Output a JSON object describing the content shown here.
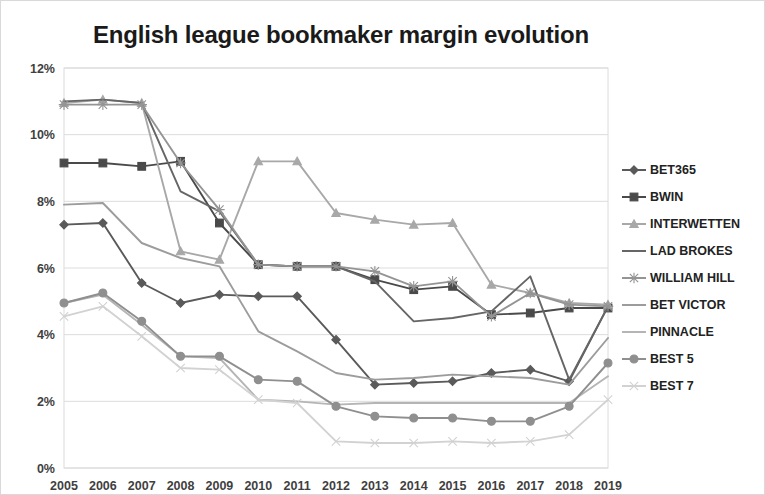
{
  "chart_data": {
    "type": "line",
    "title": "English league bookmaker margin evolution",
    "xlabel": "",
    "ylabel": "",
    "ylim": [
      0,
      12
    ],
    "ytick_labels": [
      "0%",
      "2%",
      "4%",
      "6%",
      "8%",
      "10%",
      "12%"
    ],
    "ytick_values": [
      0,
      2,
      4,
      6,
      8,
      10,
      12
    ],
    "grid": true,
    "legend_position": "right",
    "categories": [
      2005,
      2006,
      2007,
      2008,
      2009,
      2010,
      2011,
      2012,
      2013,
      2014,
      2015,
      2016,
      2017,
      2018,
      2019
    ],
    "xtick_labels": [
      "2005",
      "2006",
      "2007",
      "2008",
      "2009",
      "2010",
      "2011",
      "2012",
      "2013",
      "2014",
      "2015",
      "2016",
      "2017",
      "2018",
      "2019"
    ],
    "series": [
      {
        "name": "BET365",
        "color": "#5a5a5a",
        "marker": "diamond",
        "values": [
          7.3,
          7.35,
          5.55,
          4.95,
          5.2,
          5.15,
          5.15,
          3.85,
          2.5,
          2.55,
          2.6,
          2.85,
          2.95,
          2.6,
          4.85
        ]
      },
      {
        "name": "BWIN",
        "color": "#4a4a4a",
        "marker": "square",
        "values": [
          9.15,
          9.15,
          9.05,
          9.2,
          7.35,
          6.1,
          6.05,
          6.05,
          5.65,
          5.35,
          5.45,
          4.6,
          4.65,
          4.8,
          4.8
        ]
      },
      {
        "name": "INTERWETTEN",
        "color": "#a8a8a8",
        "marker": "triangle",
        "values": [
          10.95,
          11.05,
          10.95,
          6.5,
          6.25,
          9.2,
          9.2,
          7.65,
          7.45,
          7.3,
          7.35,
          5.5,
          5.25,
          4.95,
          4.9
        ]
      },
      {
        "name": "LAD BROKES",
        "color": "#666666",
        "marker": "none",
        "values": [
          11.0,
          11.05,
          10.95,
          8.3,
          7.7,
          6.1,
          6.05,
          6.05,
          5.6,
          4.4,
          4.5,
          4.7,
          5.75,
          2.65,
          4.85
        ]
      },
      {
        "name": "WILLIAM HILL",
        "color": "#949494",
        "marker": "star",
        "values": [
          10.9,
          10.9,
          10.9,
          9.15,
          7.75,
          6.1,
          6.05,
          6.05,
          5.9,
          5.45,
          5.6,
          4.55,
          5.25,
          4.9,
          4.85
        ]
      },
      {
        "name": "BET VICTOR",
        "color": "#9c9c9c",
        "marker": "none",
        "values": [
          7.9,
          7.95,
          6.75,
          6.3,
          6.05,
          4.1,
          3.5,
          2.85,
          2.65,
          2.7,
          2.8,
          2.75,
          2.7,
          2.5,
          3.9
        ]
      },
      {
        "name": "PINNACLE",
        "color": "#b5b5b5",
        "marker": "none",
        "values": [
          4.95,
          5.2,
          4.3,
          3.35,
          3.3,
          2.05,
          2.0,
          1.9,
          1.95,
          1.95,
          1.95,
          1.95,
          1.95,
          1.95,
          2.75
        ]
      },
      {
        "name": "BEST 5",
        "color": "#8f8f8f",
        "marker": "circle",
        "values": [
          4.95,
          5.25,
          4.4,
          3.35,
          3.35,
          2.65,
          2.6,
          1.85,
          1.55,
          1.5,
          1.5,
          1.4,
          1.4,
          1.85,
          3.15
        ]
      },
      {
        "name": "BEST 7",
        "color": "#d2d2d2",
        "marker": "x",
        "values": [
          4.55,
          4.85,
          3.95,
          3.0,
          2.95,
          2.05,
          1.95,
          0.8,
          0.75,
          0.75,
          0.8,
          0.75,
          0.8,
          1.0,
          2.05
        ]
      }
    ]
  },
  "legend": {
    "items": [
      {
        "label": "BET365"
      },
      {
        "label": "BWIN"
      },
      {
        "label": "INTERWETTEN"
      },
      {
        "label": "LAD BROKES"
      },
      {
        "label": "WILLIAM HILL"
      },
      {
        "label": "BET VICTOR"
      },
      {
        "label": "PINNACLE"
      },
      {
        "label": "BEST 5"
      },
      {
        "label": "BEST 7"
      }
    ]
  }
}
